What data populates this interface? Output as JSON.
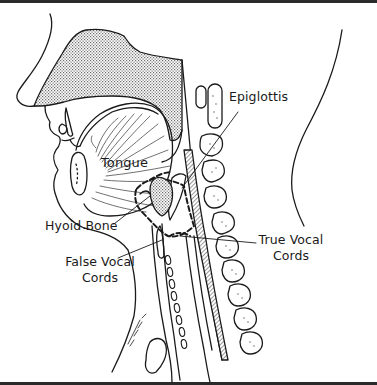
{
  "figure": {
    "labels": {
      "epiglottis": "Epiglottis",
      "tongue": "Tongue",
      "hyoid_bone": "Hyoid Bone",
      "true_vocal_cords_line1": "True Vocal",
      "true_vocal_cords_line2": "Cords",
      "false_vocal_cords_line1": "False Vocal",
      "false_vocal_cords_line2": "Cords"
    },
    "signature": "illustrator signature",
    "colors": {
      "ink": "#1a1a1a",
      "stipple": "#9a9a9a",
      "background": "#ffffff",
      "frame": "#2a2a2a"
    }
  }
}
